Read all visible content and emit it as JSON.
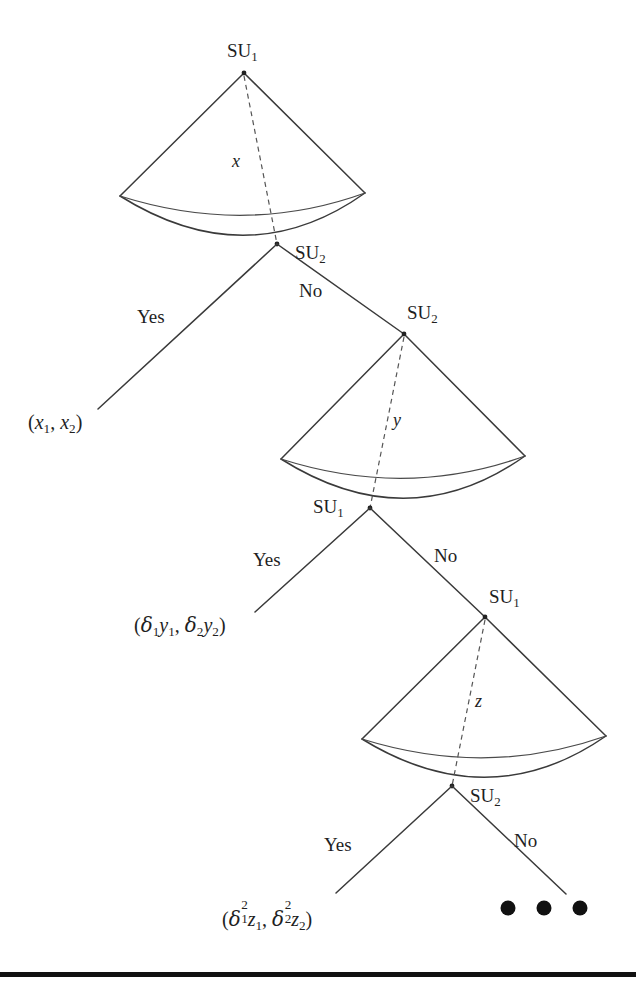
{
  "figure": {
    "type": "decision-tree-diagram",
    "background": "#ffffff",
    "line_color": "#3a3a3a",
    "dash_color": "#555555",
    "text_color": "#1f1f1f",
    "rule_color": "#111111"
  },
  "nodes": [
    {
      "id": "cone-1",
      "apex_label": "SU",
      "apex_sub": "1",
      "axis_label": "x",
      "base_label": "SU",
      "base_sub": "2",
      "yes_label": "Yes",
      "no_label": "No"
    },
    {
      "id": "cone-2",
      "apex_label": "SU",
      "apex_sub": "2",
      "axis_label": "y",
      "base_label": "SU",
      "base_sub": "1",
      "yes_label": "Yes",
      "no_label": "No"
    },
    {
      "id": "cone-3",
      "apex_label": "SU",
      "apex_sub": "1",
      "axis_label": "z",
      "base_label": "SU",
      "base_sub": "2",
      "yes_label": "Yes",
      "no_label": "No"
    }
  ],
  "leaves": [
    {
      "id": "leaf-1",
      "text": "(x1, x2)",
      "parts": {
        "open": "(",
        "v1": "x",
        "v1sub": "1",
        "comma": ", ",
        "v2": "x",
        "v2sub": "2",
        "close": ")"
      }
    },
    {
      "id": "leaf-2",
      "text": "(d1y1, d2y2)",
      "parts": {
        "open": "(",
        "d1": "δ",
        "d1sub": "1",
        "v1": "y",
        "v1sub": "1",
        "comma": ", ",
        "d2": "δ",
        "d2sub": "2",
        "v2": "y",
        "v2sub": "2",
        "close": ")"
      }
    },
    {
      "id": "leaf-3",
      "text": "(d1^2 z1, d2^2 z2)",
      "parts": {
        "open": "(",
        "d1": "δ",
        "d1sup": "2",
        "d1sub": "1",
        "v1": "z",
        "v1sub": "1",
        "comma": ", ",
        "d2": "δ",
        "d2sup": "2",
        "d2sub": "2",
        "v2": "z",
        "v2sub": "2",
        "close": ")"
      }
    }
  ],
  "ellipsis": {
    "label": "• • •",
    "dot_count": 3
  }
}
